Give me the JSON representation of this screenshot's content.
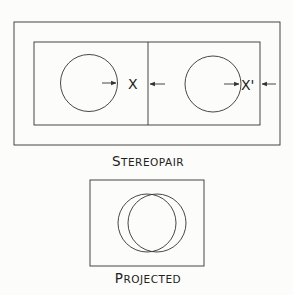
{
  "diagram": {
    "stereopair": {
      "caption_initial": "S",
      "caption_rest": "TEREOPAIR",
      "left_label": "X",
      "right_label": "X'"
    },
    "projected": {
      "caption_initial": "P",
      "caption_rest": "ROJECTED"
    },
    "colors": {
      "stroke": "#333333",
      "background": "#fcfcfa"
    }
  }
}
